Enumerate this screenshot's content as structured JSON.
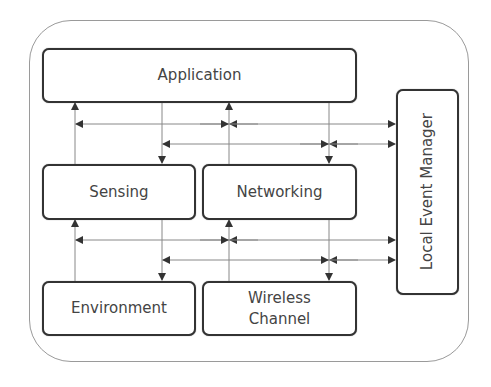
{
  "diagram": {
    "title": "",
    "nodes": [
      {
        "id": "application",
        "label": "Application"
      },
      {
        "id": "sensing",
        "label": "Sensing"
      },
      {
        "id": "networking",
        "label": "Networking"
      },
      {
        "id": "environment",
        "label": "Environment"
      },
      {
        "id": "wireless_channel",
        "label_line1": "Wireless",
        "label_line2": "Channel"
      },
      {
        "id": "local_event_manager",
        "label": "Local Event Manager"
      }
    ],
    "edges": [
      {
        "from": "sensing",
        "to": "application"
      },
      {
        "from": "application",
        "to": "sensing"
      },
      {
        "from": "networking",
        "to": "application"
      },
      {
        "from": "application",
        "to": "networking"
      },
      {
        "from": "environment",
        "to": "sensing"
      },
      {
        "from": "sensing",
        "to": "environment"
      },
      {
        "from": "wireless_channel",
        "to": "networking"
      },
      {
        "from": "networking",
        "to": "wireless_channel"
      },
      {
        "from": "application",
        "to": "local_event_manager",
        "bidirectional": true
      },
      {
        "from": "sensing",
        "to": "local_event_manager",
        "bidirectional": true
      },
      {
        "from": "networking",
        "to": "local_event_manager",
        "bidirectional": true
      },
      {
        "from": "environment",
        "to": "local_event_manager",
        "bidirectional": true
      },
      {
        "from": "wireless_channel",
        "to": "local_event_manager",
        "bidirectional": true
      }
    ]
  }
}
